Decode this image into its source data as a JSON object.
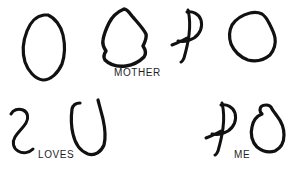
{
  "figure": {
    "title": "MOTHER LOVES ME",
    "background_color": "#ffffff",
    "ink_color": "#111111",
    "caption_color": "#1f1f1f"
  },
  "captions": [
    {
      "id": "mother",
      "text": "MOTHER",
      "x": 114,
      "y": 68
    },
    {
      "id": "loves",
      "text": "LOVES",
      "x": 38,
      "y": 150
    },
    {
      "id": "me",
      "text": "ME",
      "x": 234,
      "y": 150
    }
  ],
  "glyphs": [
    {
      "id": "glyph-1",
      "name": "closed-oval-loop",
      "row": "top",
      "order": 1,
      "stroke_width": 3.2,
      "closed": true,
      "bbox": [
        22,
        13,
        44,
        68
      ],
      "path": "M 44 15 C 36 16 30 23 27 31 C 23 41 22 52 25 62 C 28 71 35 79 43 80 C 51 80 58 73 62 64 C 65 55 65 44 63 35 C 61 26 55 18 48 15 Z"
    },
    {
      "id": "glyph-2",
      "name": "closed-angular-blob",
      "row": "top",
      "order": 2,
      "stroke_width": 3.4,
      "closed": true,
      "bbox": [
        101,
        8,
        47,
        59
      ],
      "path": "M 124 9 C 117 12 112 17 109 23 C 106 29 104 34 103 40 C 102 45 104 48 106 51 C 104 54 103 57 105 60 C 110 65 118 67 126 66 C 133 65 139 62 144 57 C 147 53 145 49 143 46 C 145 42 147 38 146 34 C 143 28 137 22 132 16 C 129 12 127 9 124 9 Z"
    },
    {
      "id": "glyph-3",
      "name": "p-letter-scribble",
      "row": "top",
      "order": 3,
      "stroke_width": 3.0,
      "closed": false,
      "bbox": [
        171,
        8,
        32,
        55
      ],
      "path": "M 188 10 C 190 18 190 27 189 35 C 188 43 186 51 184 58 C 183 60 182 62 181 62"
    },
    {
      "id": "glyph-3b",
      "name": "p-letter-bowl",
      "row": "top",
      "order": 3,
      "stroke_width": 3.0,
      "closed": false,
      "bbox": [
        171,
        8,
        32,
        55
      ],
      "path": "M 187 12 C 193 11 199 14 201 20 C 203 27 200 34 194 38 C 189 41 183 42 178 41"
    },
    {
      "id": "glyph-3c",
      "name": "p-letter-crossbar",
      "row": "top",
      "order": 3,
      "stroke_width": 3.0,
      "closed": false,
      "bbox": [
        171,
        8,
        32,
        55
      ],
      "path": "M 172 45 C 177 43 182 41 187 38"
    },
    {
      "id": "glyph-4",
      "name": "closed-round-polygon",
      "row": "top",
      "order": 4,
      "stroke_width": 3.2,
      "closed": true,
      "bbox": [
        228,
        11,
        48,
        52
      ],
      "path": "M 250 13 C 242 15 236 19 232 25 C 229 31 229 38 231 44 C 234 51 240 57 248 60 C 256 62 264 60 270 55 C 274 50 276 44 275 38 C 274 32 271 27 269 23 C 267 19 265 16 262 14 C 258 12 254 12 250 13 Z"
    },
    {
      "id": "glyph-5",
      "name": "s-curve-scribble",
      "row": "bottom",
      "order": 1,
      "stroke_width": 3.0,
      "closed": false,
      "bbox": [
        9,
        108,
        28,
        48
      ],
      "path": "M 11 114 C 13 110 18 108 23 110 C 28 112 29 118 26 123 C 23 128 18 132 15 137 C 12 142 13 148 18 151 C 23 154 29 153 33 149"
    },
    {
      "id": "glyph-6",
      "name": "u-vase-scribble",
      "row": "bottom",
      "order": 2,
      "stroke_width": 3.2,
      "closed": false,
      "bbox": [
        69,
        99,
        38,
        57
      ],
      "path": "M 80 103 C 76 103 73 105 72 109 C 71 117 71 126 73 134 C 75 143 80 151 88 154 C 95 156 101 152 104 145 C 106 137 105 128 103 119 C 101 111 99 104 98 100"
    },
    {
      "id": "glyph-7",
      "name": "p-letter-scribble-2",
      "row": "bottom",
      "order": 3,
      "stroke_width": 3.0,
      "closed": false,
      "bbox": [
        205,
        101,
        32,
        55
      ],
      "path": "M 222 103 C 224 111 224 120 223 128 C 222 136 220 144 218 151 C 217 153 216 155 215 155"
    },
    {
      "id": "glyph-7b",
      "name": "p-letter-bowl-2",
      "row": "bottom",
      "order": 3,
      "stroke_width": 3.0,
      "closed": false,
      "bbox": [
        205,
        101,
        32,
        55
      ],
      "path": "M 221 105 C 227 104 233 107 235 113 C 237 120 234 127 228 131 C 223 134 217 135 212 134"
    },
    {
      "id": "glyph-7c",
      "name": "p-letter-crossbar-2",
      "row": "bottom",
      "order": 3,
      "stroke_width": 3.0,
      "closed": false,
      "bbox": [
        205,
        101,
        32,
        55
      ],
      "path": "M 206 138 C 211 136 216 134 221 131"
    },
    {
      "id": "glyph-8",
      "name": "closed-blob-with-tab",
      "row": "bottom",
      "order": 4,
      "stroke_width": 3.2,
      "closed": true,
      "bbox": [
        251,
        103,
        33,
        50
      ],
      "path": "M 266 105 C 262 105 260 107 260 110 C 260 112 261 113 262 114 C 257 116 253 121 252 127 C 250 134 252 142 257 147 C 262 151 269 153 275 151 C 281 148 284 142 284 135 C 284 128 281 121 277 116 C 275 113 273 111 272 109 C 271 106 269 105 266 105 Z"
    }
  ]
}
